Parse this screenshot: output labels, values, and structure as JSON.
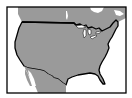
{
  "map": {
    "kind": "locator-map",
    "subject": "Contiguous United States",
    "regions": [
      {
        "name": "United States",
        "role": "highlighted",
        "fill": "#9a9a9a",
        "outline": "#000000"
      },
      {
        "name": "Canada",
        "role": "context",
        "fill": "#9a9a9a"
      },
      {
        "name": "Mexico",
        "role": "context",
        "fill": "#9a9a9a"
      }
    ],
    "colors": {
      "land": "#9a9a9a",
      "water": "#ffffff",
      "frame": "#000000",
      "border_line": "#000000"
    }
  }
}
